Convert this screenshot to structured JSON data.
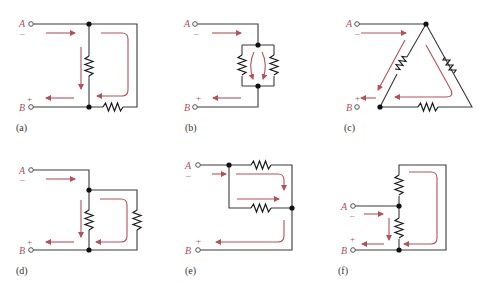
{
  "figure": {
    "colors": {
      "wire": "#3a3a3a",
      "arrow": "#b5505a",
      "label": "#b05060"
    },
    "panels": [
      {
        "id": "a",
        "caption": "(a)",
        "terminal_a": "A",
        "terminal_b": "B",
        "sign_a": "–",
        "sign_b": "+"
      },
      {
        "id": "b",
        "caption": "(b)",
        "terminal_a": "A",
        "terminal_b": "B",
        "sign_a": "–",
        "sign_b": "+"
      },
      {
        "id": "c",
        "caption": "(c)",
        "terminal_a": "A",
        "terminal_b": "B",
        "sign_a": "–",
        "sign_b": "+"
      },
      {
        "id": "d",
        "caption": "(d)",
        "terminal_a": "A",
        "terminal_b": "B",
        "sign_a": "–",
        "sign_b": "+"
      },
      {
        "id": "e",
        "caption": "(e)",
        "terminal_a": "A",
        "terminal_b": "B",
        "sign_a": "–",
        "sign_b": "+"
      },
      {
        "id": "f",
        "caption": "(f)",
        "terminal_a": "A",
        "terminal_b": "B",
        "sign_a": "–",
        "sign_b": "+"
      }
    ]
  }
}
